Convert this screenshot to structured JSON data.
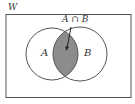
{
  "diagram": {
    "type": "venn",
    "universe": {
      "label": "W"
    },
    "sets": [
      {
        "label": "A"
      },
      {
        "label": "B"
      }
    ],
    "intersection": {
      "label": "A ∩ B",
      "shaded": true
    },
    "colors": {
      "stroke": "#555555",
      "shade": "#8c8c8c",
      "background": "#ffffff"
    }
  }
}
